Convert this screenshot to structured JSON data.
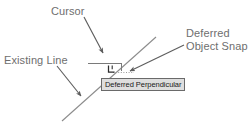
{
  "diagram": {
    "callouts": [
      {
        "id": "cursor",
        "text": "Cursor"
      },
      {
        "id": "existing_line",
        "text": "Existing Line"
      },
      {
        "id": "deferred_object_snap_line1",
        "text": "Deferred"
      },
      {
        "id": "deferred_object_snap_line2",
        "text": "Object Snap"
      }
    ],
    "tooltip": {
      "text": "Deferred Perpendicular"
    },
    "colors": {
      "background": "#ffffff",
      "label_text": "#6e6e6e",
      "arrow": "#5d5d5d",
      "geometry_line": "#8c8c8c",
      "crosshair": "#7a7a7a",
      "tooltip_background": "#dedede",
      "tooltip_border": "#6a6a6a",
      "tooltip_text": "#1a1a1a",
      "snap_marker": "#2b2b2b"
    }
  }
}
